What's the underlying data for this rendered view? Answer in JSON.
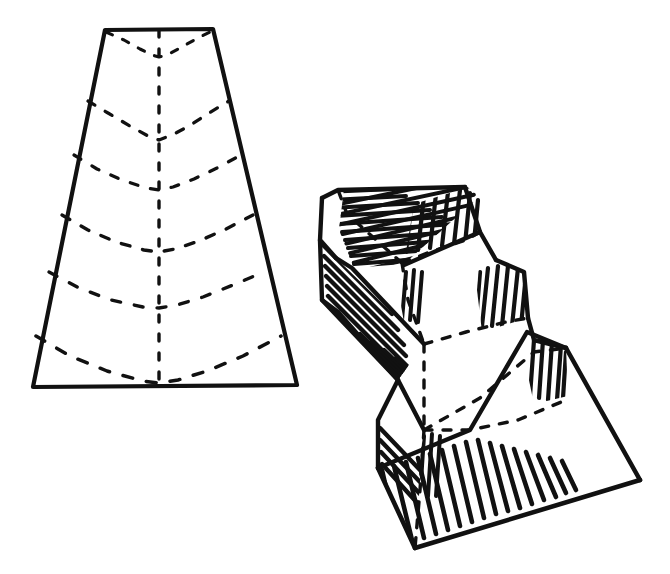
{
  "figure": {
    "background_color": "#ffffff",
    "ink_color": "#111111",
    "canvas": {
      "width": 670,
      "height": 574
    },
    "panels": [
      {
        "id": "pattern",
        "name": "flat-fold-pattern",
        "description": "Trapezoidal flat sheet with dashed chevron fold lines and a dashed vertical centre fold",
        "outline_label": "trapezoid-outline",
        "outline_points": "105,30 213,29 297,385 33,387",
        "centre_fold_label": "centre-fold-line",
        "centre_fold_points": "159,30 159,386",
        "chevrons": [
          {
            "label": "chevron-1",
            "points": "106,32 124,40 140,49 152,55 159,57 167,55 180,48 196,39 212,31"
          },
          {
            "label": "chevron-2",
            "points": "88,101 108,113 130,126 148,136 159,140 172,135 189,126 209,113 229,101"
          },
          {
            "label": "chevron-3",
            "points": "74,155 97,169 122,180 146,188 159,190 173,187 194,179 217,168 241,155"
          },
          {
            "label": "chevron-4",
            "points": "62,215 88,230 116,242 144,250 159,252 175,249 199,241 226,229 253,215"
          },
          {
            "label": "chevron-5",
            "points": "49,272 79,288 111,300 143,307 159,308 177,305 203,297 233,285 264,272"
          },
          {
            "label": "chevron-6",
            "points": "36,336 70,356 107,371 143,381 159,383 178,380 207,371 243,356 281,336"
          }
        ]
      },
      {
        "id": "solid",
        "name": "pleated-solid-figure",
        "description": "Three-tier folded solid drawn in perspective with hatched shading on the fold bands and dashed hidden valley folds",
        "faces": [
          {
            "label": "top-step-upper-face",
            "points": "322,198 338,190 465,187 478,196 402,263 352,268"
          },
          {
            "label": "top-step-right-face",
            "points": "465,187 478,196 480,232 404,265 402,263"
          },
          {
            "label": "top-step-hatch-band",
            "points": "338,190 465,187 478,196 402,263 352,268 336,258"
          },
          {
            "label": "second-step-upper-face",
            "points": "352,268 402,263 496,260 524,272 477,336 424,344"
          },
          {
            "label": "second-step-right-face",
            "points": "496,260 524,272 528,318 482,382 477,336"
          },
          {
            "label": "second-step-hatch-band",
            "points": "322,300 352,268 424,344 398,380"
          },
          {
            "label": "third-step-upper-face",
            "points": "378,468 424,344 477,336 527,332 566,348 520,420 470,430"
          },
          {
            "label": "third-step-right-face",
            "points": "527,332 566,348 640,480 520,420"
          },
          {
            "label": "base-face",
            "points": "378,468 470,430 640,480 415,548"
          }
        ],
        "solid_edges": [
          {
            "label": "edge-top-left-ridge",
            "points": "322,198 338,190 465,187"
          },
          {
            "label": "edge-top-right-slope",
            "points": "465,187 480,232 496,260"
          },
          {
            "label": "edge-top-left-fold",
            "points": "322,198 320,240 336,258"
          },
          {
            "label": "edge-first-valley",
            "points": "336,258 352,268 424,344"
          },
          {
            "label": "edge-second-ridge-top",
            "points": "496,260 524,272 528,318"
          },
          {
            "label": "edge-second-ridge-left",
            "points": "320,240 322,300 338,312"
          },
          {
            "label": "edge-second-valley",
            "points": "338,312 398,380 424,430"
          },
          {
            "label": "edge-second-right-drop",
            "points": "528,318 534,340 566,348"
          },
          {
            "label": "edge-third-ridge-left",
            "points": "398,380 378,420 378,468"
          },
          {
            "label": "edge-third-top",
            "points": "566,348 640,480"
          },
          {
            "label": "edge-base-right",
            "points": "640,480 415,548"
          },
          {
            "label": "edge-base-left",
            "points": "378,468 415,548"
          },
          {
            "label": "edge-third-band",
            "points": "378,468 470,430 527,332 566,348"
          },
          {
            "label": "edge-second-band",
            "points": "322,300 398,380"
          },
          {
            "label": "edge-inner-step-right",
            "points": "480,232 404,265"
          }
        ],
        "hidden_folds": [
          {
            "label": "hidden-valley-1",
            "points": "402,263 347,214 338,190"
          },
          {
            "label": "hidden-valley-2",
            "points": "402,263 430,252 466,240 480,232"
          },
          {
            "label": "hidden-valley-3",
            "points": "402,263 408,300 424,344"
          },
          {
            "label": "hidden-valley-4",
            "points": "424,344 466,332 506,322 528,318"
          },
          {
            "label": "hidden-valley-5",
            "points": "424,344 424,400 424,430"
          },
          {
            "label": "hidden-valley-6",
            "points": "424,430 470,430 518,420 566,400"
          },
          {
            "label": "hidden-valley-7",
            "points": "424,430 420,490 415,548"
          },
          {
            "label": "hidden-valley-8",
            "points": "424,430 480,398 534,352 566,348"
          }
        ],
        "hatch_bands": [
          {
            "label": "hatch-top-ridge",
            "angle_note": "parallel to the upper ridge",
            "density": 14
          },
          {
            "label": "hatch-upper-left-wing",
            "angle_note": "parallel to the left wing fold",
            "density": 16
          },
          {
            "label": "hatch-mid-left-wing",
            "angle_note": "parallel to the middle wing fold",
            "density": 18
          },
          {
            "label": "hatch-lower-left-wing",
            "angle_note": "parallel to the lower base fold",
            "density": 20
          },
          {
            "label": "hatch-vertical-risers",
            "angle_note": "near vertical on the step risers",
            "density": 7
          }
        ]
      }
    ]
  }
}
